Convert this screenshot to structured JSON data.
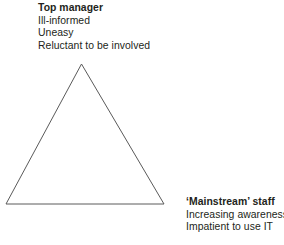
{
  "figure": {
    "background_color": "#ffffff",
    "line_color": "#5a5a5a"
  },
  "shape": {
    "name": "triangle",
    "apex_label": "top-vertex",
    "base_label": "base"
  },
  "annotations": {
    "top": {
      "title": "Top manager",
      "lines": [
        "Ill-informed",
        "Uneasy",
        "Reluctant to be involved"
      ]
    },
    "bottom": {
      "title": "‘Mainstream’ staff",
      "lines": [
        "Increasing awareness",
        "Impatient to use IT"
      ]
    }
  }
}
